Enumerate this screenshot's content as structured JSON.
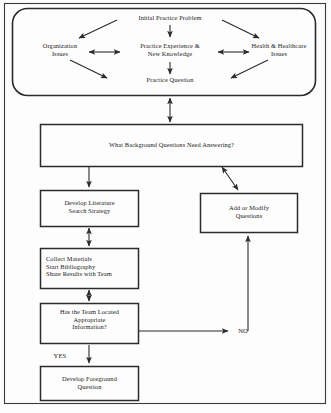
{
  "diagram": {
    "colors": {
      "line": "#2b2b2b",
      "text": "#1a1a1a",
      "background": "#fdfdfd",
      "border": "#3a3a3a"
    },
    "top_group": {
      "name": "rounded-problem-group",
      "nodes": [
        {
          "id": "initial-practice-problem",
          "label": "Initial Practice Problem"
        },
        {
          "id": "organization-issues",
          "label": "Organization\nIssues"
        },
        {
          "id": "practice-experience-new-knowledge",
          "label": "Practice Experience &\nNew Knowledge"
        },
        {
          "id": "health-healthcare-issues",
          "label": "Health & Healthcare\nIssues"
        },
        {
          "id": "practice-question",
          "label": "Practice Question"
        }
      ]
    },
    "boxes": [
      {
        "id": "background-questions",
        "label": "What Background Questions Need Answering?"
      },
      {
        "id": "develop-literature-search-strategy",
        "label": "Develop Literature\nSearch Strategy"
      },
      {
        "id": "add-or-modify-questions",
        "label": "Add or Modify\nQuestions"
      },
      {
        "id": "collect-materials",
        "label": "Collect Materials\nStart Bibliography\nShare Results with Team"
      },
      {
        "id": "team-located-information",
        "label": "Has the Team Located\nAppropriate\nInformation?"
      },
      {
        "id": "develop-foreground-question",
        "label": "Develop Foreground\nQuestion"
      }
    ],
    "edge_labels": [
      {
        "id": "yes-label",
        "label": "YES"
      },
      {
        "id": "no-label",
        "label": "NO"
      }
    ]
  }
}
